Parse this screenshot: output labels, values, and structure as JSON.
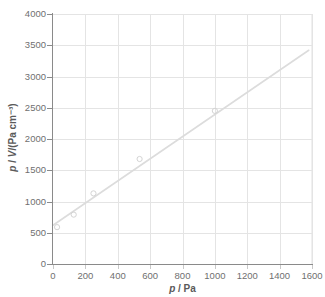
{
  "chart_data": {
    "type": "scatter",
    "title": "",
    "xlabel": "p / Pa",
    "ylabel": "p / V/(Pa cm⁻³)",
    "xlabel_parts": {
      "sym1": "p",
      "sep": " / Pa"
    },
    "ylabel_parts": {
      "sym1": "p",
      "mid": " / ",
      "sym2": "V",
      "rest": "/(Pa cm⁻³)"
    },
    "xlim": [
      0,
      1600
    ],
    "ylim": [
      0,
      4000
    ],
    "xticks": [
      0,
      200,
      400,
      600,
      800,
      1000,
      1200,
      1400,
      1600
    ],
    "yticks": [
      0,
      500,
      1000,
      1500,
      2000,
      2500,
      3000,
      3500,
      4000
    ],
    "xtick_labels": [
      "0",
      "200",
      "400",
      "600",
      "800",
      "1000",
      "1200",
      "1400",
      "1600"
    ],
    "ytick_labels": [
      "0",
      "500",
      "1000",
      "1500",
      "2000",
      "2500",
      "3000",
      "3500",
      "4000"
    ],
    "grid": true,
    "grid_axes": "both",
    "legend": false,
    "legend_position": "none",
    "marker": "open-circle",
    "marker_size": 4,
    "series": [
      {
        "name": "p/V vs p",
        "type": "scatter",
        "x": [
          25,
          128,
          250,
          535,
          1000
        ],
        "y": [
          590,
          790,
          1130,
          1680,
          2450
        ]
      }
    ],
    "trendline": {
      "type": "linear",
      "x": [
        0,
        1580
      ],
      "y": [
        620,
        3420
      ],
      "slope": 1.772,
      "intercept": 620
    },
    "colors": {
      "marker_stroke": "#d4d4d4",
      "marker_fill": "none",
      "trendline": "#dcdcdc",
      "gridline": "#e4e4e4",
      "axis": "#8a8a8a",
      "tick_text": "#6f6f6f",
      "axis_title": "#5a5a5a",
      "background": "#ffffff"
    }
  }
}
